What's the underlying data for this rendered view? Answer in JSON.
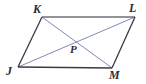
{
  "figure": {
    "name": "parallelogram-with-diagonals",
    "background_color": "#ffffff",
    "width": 146,
    "height": 84,
    "side_color": "#3a3a42",
    "diagonal_color": "#8089b8",
    "label_color": "#2b2b33"
  },
  "labels": {
    "K": "K",
    "L": "L",
    "J": "J",
    "M": "M",
    "P": "P"
  },
  "diagram_data": {
    "type": "geometry-parallelogram",
    "vertices": [
      {
        "id": "K",
        "label": "K",
        "x": 42,
        "y": 17
      },
      {
        "id": "L",
        "label": "L",
        "x": 135,
        "y": 17
      },
      {
        "id": "M",
        "label": "M",
        "x": 112,
        "y": 68
      },
      {
        "id": "J",
        "label": "J",
        "x": 18,
        "y": 67
      }
    ],
    "interior_points": [
      {
        "id": "P",
        "label": "P",
        "x": 76.5,
        "y": 41
      }
    ],
    "sides": [
      {
        "from": "K",
        "to": "L",
        "name": "KL",
        "color": "#3a3a42"
      },
      {
        "from": "L",
        "to": "M",
        "name": "LM",
        "color": "#3a3a42"
      },
      {
        "from": "M",
        "to": "J",
        "name": "MJ",
        "color": "#3a3a42"
      },
      {
        "from": "J",
        "to": "K",
        "name": "JK",
        "color": "#3a3a42"
      }
    ],
    "diagonals": [
      {
        "from": "K",
        "to": "M",
        "name": "KM",
        "color": "#8089b8"
      },
      {
        "from": "J",
        "to": "L",
        "name": "JL",
        "color": "#8089b8"
      }
    ]
  }
}
